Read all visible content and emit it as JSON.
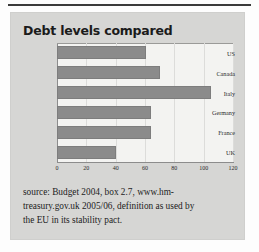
{
  "figure": {
    "title": "Debt levels compared",
    "panel_color": "#d6d6d4",
    "plot_color": "#f3f3f1",
    "bar_color": "#8b8b8b"
  },
  "source": {
    "line1": "source: Budget 2004, box 2.7, www.hm-",
    "line2": "treasury.gov.uk 2005/06, definition as used by",
    "line3": "the EU in its stability pact."
  },
  "chart_data": {
    "type": "bar",
    "orientation": "horizontal",
    "title": "Debt levels compared",
    "categories": [
      "US",
      "Canada",
      "Italy",
      "Germany",
      "France",
      "UK"
    ],
    "values": [
      61,
      70,
      105,
      64,
      64,
      40
    ],
    "xlabel": "",
    "ylabel": "",
    "xlim": [
      0,
      120
    ],
    "xticks": [
      0,
      20,
      40,
      60,
      80,
      100,
      120
    ],
    "xticklabels": [
      "0",
      "20",
      "40",
      "60",
      "80",
      "100",
      "120"
    ],
    "grid": true,
    "legend": false
  }
}
